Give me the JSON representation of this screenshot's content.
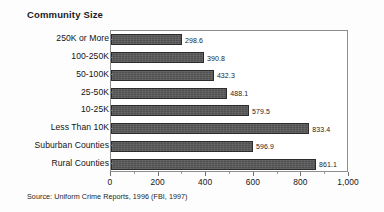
{
  "chart_data": {
    "type": "bar",
    "orientation": "horizontal",
    "title": "Community Size",
    "xlabel": "",
    "ylabel": "",
    "xlim": [
      0,
      1000
    ],
    "grid": false,
    "legend": null,
    "categories": [
      "250K or More",
      "100-250K",
      "50-100K",
      "25-50K",
      "10-25K",
      "Less Than 10K",
      "Suburban Counties",
      "Rural Counties"
    ],
    "values": [
      298.6,
      390.8,
      432.3,
      488.1,
      579.5,
      833.4,
      596.9,
      861.1
    ],
    "value_labels": [
      "298.6",
      "390.8",
      "432.3",
      "488.1",
      "579.5",
      "833.4",
      "596.9",
      "861.1"
    ],
    "xticks": [
      0,
      200,
      400,
      600,
      800,
      1000
    ],
    "xtick_labels": [
      "0",
      "200",
      "400",
      "600",
      "800",
      "1,000"
    ],
    "xtick_minor": [
      100,
      300,
      500,
      700,
      900
    ],
    "bar_color": "#595959",
    "bar_border_color": "#2c2c2c",
    "frame_color": "#8d8d8d",
    "text_color": "#141414",
    "annotations": [
      "Source: Uniform Crime Reports, 1996 (FBI, 1997)"
    ]
  },
  "source": {
    "note": "Source: Uniform Crime Reports, 1996 (FBI, 1997)"
  }
}
